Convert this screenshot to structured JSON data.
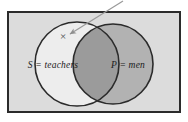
{
  "figure": {
    "canvas": {
      "width": 188,
      "height": 122,
      "background": "#ffffff"
    },
    "universal_set": {
      "name": "universe-rectangle",
      "fill": "#dcdcdc",
      "stroke": "#2b2b2b",
      "stroke_width": 2,
      "x": 8,
      "y": 12,
      "width": 172,
      "height": 100
    },
    "circles": [
      {
        "id": "set-s",
        "label": "S = teachers",
        "symbol": "S",
        "set_name": "teachers",
        "cx": 77,
        "cy": 64,
        "r": 42,
        "fill": "#ededed",
        "stroke": "#2b2b2b",
        "stroke_width": 1.6,
        "label_x": 53,
        "label_y": 68
      },
      {
        "id": "set-p",
        "label": "P = men",
        "symbol": "P",
        "set_name": "men",
        "cx": 113,
        "cy": 64,
        "r": 40,
        "fill": "#b2b2b2",
        "stroke": "#2b2b2b",
        "stroke_width": 1.6,
        "label_x": 110,
        "label_y": 68
      }
    ],
    "intersection": {
      "name": "intersection-region",
      "fill": "#9b9b9b"
    },
    "annotations": [
      {
        "name": "x-mark",
        "text": "×",
        "x": 63,
        "y": 40,
        "color": "#4a4a4a",
        "meaning": "element in S only"
      },
      {
        "name": "pointer-arrow",
        "from_x": 123,
        "from_y": 1,
        "to_x": 68,
        "to_y": 35,
        "color": "#9a9a9a",
        "stroke_width": 1.2
      }
    ]
  }
}
